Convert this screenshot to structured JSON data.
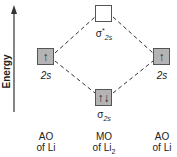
{
  "axis": {
    "label": "Energy",
    "direction": "up"
  },
  "orbitals": {
    "left_ao": {
      "label": "2s",
      "electrons": "↑",
      "filled": true
    },
    "right_ao": {
      "label": "2s",
      "electrons": "↑",
      "filled": true
    },
    "antibonding": {
      "symbol": "σ",
      "superscript": "*",
      "subscript": "2s",
      "electrons": "",
      "filled": false
    },
    "bonding": {
      "symbol": "σ",
      "subscript": "2s",
      "electrons": "↑↓",
      "filled": true
    }
  },
  "columns": {
    "left": {
      "line1": "AO",
      "line2": "of Li"
    },
    "middle": {
      "line1": "MO",
      "line2": "of Li",
      "line2_sub": "2"
    },
    "right": {
      "line1": "AO",
      "line2": "of Li"
    }
  },
  "colors": {
    "box_fill": "#b4b4b4",
    "line": "#333333"
  }
}
